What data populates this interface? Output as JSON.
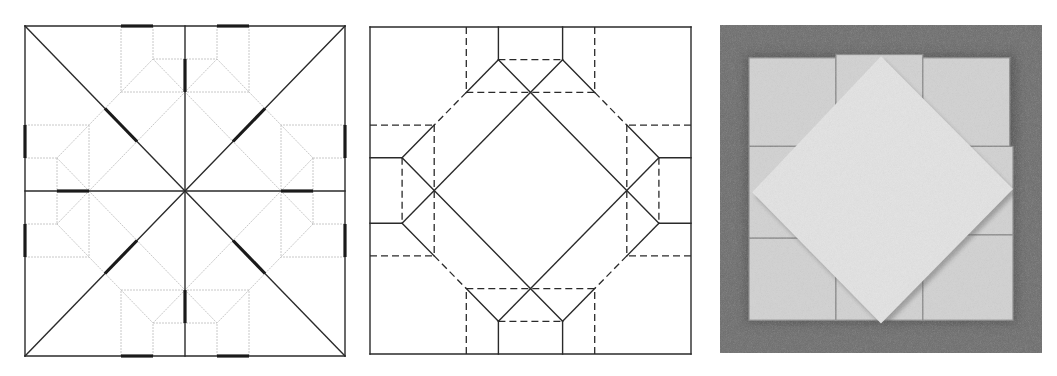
{
  "figure": {
    "description": "Origami crease pattern, fold-line diagram and photo of folded result",
    "panels": [
      {
        "id": "crease-pattern",
        "label": "Crease pattern with reference marks",
        "grid_units": 10,
        "colors": {
          "main": "#2a2a2a",
          "light": "#c8c8c8",
          "mark": "#1a1a1a"
        },
        "main_lines": [
          [
            [
              0,
              0
            ],
            [
              10,
              0
            ]
          ],
          [
            [
              10,
              0
            ],
            [
              10,
              10
            ]
          ],
          [
            [
              10,
              10
            ],
            [
              0,
              10
            ]
          ],
          [
            [
              0,
              10
            ],
            [
              0,
              0
            ]
          ],
          [
            [
              0,
              0
            ],
            [
              10,
              10
            ]
          ],
          [
            [
              10,
              0
            ],
            [
              0,
              10
            ]
          ],
          [
            [
              5,
              0
            ],
            [
              5,
              10
            ]
          ],
          [
            [
              0,
              5
            ],
            [
              10,
              5
            ]
          ]
        ],
        "light_lines": [
          [
            [
              3,
              0
            ],
            [
              3,
              2
            ]
          ],
          [
            [
              7,
              0
            ],
            [
              7,
              2
            ]
          ],
          [
            [
              4,
              0
            ],
            [
              4,
              1
            ]
          ],
          [
            [
              6,
              0
            ],
            [
              6,
              1
            ]
          ],
          [
            [
              4,
              1
            ],
            [
              6,
              1
            ]
          ],
          [
            [
              3,
              2
            ],
            [
              7,
              2
            ]
          ],
          [
            [
              3,
              10
            ],
            [
              3,
              8
            ]
          ],
          [
            [
              7,
              10
            ],
            [
              7,
              8
            ]
          ],
          [
            [
              4,
              10
            ],
            [
              4,
              9
            ]
          ],
          [
            [
              6,
              10
            ],
            [
              6,
              9
            ]
          ],
          [
            [
              4,
              9
            ],
            [
              6,
              9
            ]
          ],
          [
            [
              3,
              8
            ],
            [
              7,
              8
            ]
          ],
          [
            [
              0,
              3
            ],
            [
              2,
              3
            ]
          ],
          [
            [
              0,
              7
            ],
            [
              2,
              7
            ]
          ],
          [
            [
              0,
              4
            ],
            [
              1,
              4
            ]
          ],
          [
            [
              0,
              6
            ],
            [
              1,
              6
            ]
          ],
          [
            [
              1,
              4
            ],
            [
              1,
              6
            ]
          ],
          [
            [
              2,
              3
            ],
            [
              2,
              7
            ]
          ],
          [
            [
              10,
              3
            ],
            [
              8,
              3
            ]
          ],
          [
            [
              10,
              7
            ],
            [
              8,
              7
            ]
          ],
          [
            [
              10,
              4
            ],
            [
              9,
              4
            ]
          ],
          [
            [
              10,
              6
            ],
            [
              9,
              6
            ]
          ],
          [
            [
              9,
              4
            ],
            [
              9,
              6
            ]
          ],
          [
            [
              8,
              3
            ],
            [
              8,
              7
            ]
          ],
          [
            [
              4,
              1
            ],
            [
              9,
              6
            ]
          ],
          [
            [
              6,
              1
            ],
            [
              1,
              6
            ]
          ],
          [
            [
              1,
              4
            ],
            [
              6,
              9
            ]
          ],
          [
            [
              9,
              4
            ],
            [
              4,
              9
            ]
          ],
          [
            [
              4,
              1
            ],
            [
              3,
              2
            ]
          ],
          [
            [
              6,
              1
            ],
            [
              7,
              2
            ]
          ],
          [
            [
              3,
              2
            ],
            [
              2,
              3
            ]
          ],
          [
            [
              7,
              2
            ],
            [
              8,
              3
            ]
          ],
          [
            [
              2,
              3
            ],
            [
              1,
              4
            ]
          ],
          [
            [
              8,
              3
            ],
            [
              9,
              4
            ]
          ],
          [
            [
              1,
              6
            ],
            [
              2,
              7
            ]
          ],
          [
            [
              9,
              6
            ],
            [
              8,
              7
            ]
          ],
          [
            [
              2,
              7
            ],
            [
              3,
              8
            ]
          ],
          [
            [
              8,
              7
            ],
            [
              7,
              8
            ]
          ],
          [
            [
              3,
              8
            ],
            [
              4,
              9
            ]
          ],
          [
            [
              7,
              8
            ],
            [
              6,
              9
            ]
          ]
        ],
        "marks": [
          [
            [
              3,
              0
            ],
            [
              4,
              0
            ]
          ],
          [
            [
              6,
              0
            ],
            [
              7,
              0
            ]
          ],
          [
            [
              3,
              10
            ],
            [
              4,
              10
            ]
          ],
          [
            [
              6,
              10
            ],
            [
              7,
              10
            ]
          ],
          [
            [
              0,
              3
            ],
            [
              0,
              4
            ]
          ],
          [
            [
              0,
              6
            ],
            [
              0,
              7
            ]
          ],
          [
            [
              10,
              3
            ],
            [
              10,
              4
            ]
          ],
          [
            [
              10,
              6
            ],
            [
              10,
              7
            ]
          ],
          [
            [
              5,
              1
            ],
            [
              5,
              2
            ]
          ],
          [
            [
              5,
              8
            ],
            [
              5,
              9
            ]
          ],
          [
            [
              1,
              5
            ],
            [
              2,
              5
            ]
          ],
          [
            [
              8,
              5
            ],
            [
              9,
              5
            ]
          ],
          [
            [
              2.5,
              2.5
            ],
            [
              3.5,
              3.5
            ]
          ],
          [
            [
              7.5,
              2.5
            ],
            [
              6.5,
              3.5
            ]
          ],
          [
            [
              2.5,
              7.5
            ],
            [
              3.5,
              6.5
            ]
          ],
          [
            [
              7.5,
              7.5
            ],
            [
              6.5,
              6.5
            ]
          ]
        ]
      },
      {
        "id": "fold-diagram",
        "label": "Mountain (solid) and valley (dashed) fold lines",
        "grid_units": 10,
        "colors": {
          "line": "#2a2a2a"
        },
        "solid_lines": [
          [
            [
              0,
              0
            ],
            [
              10,
              0
            ]
          ],
          [
            [
              10,
              0
            ],
            [
              10,
              10
            ]
          ],
          [
            [
              10,
              10
            ],
            [
              0,
              10
            ]
          ],
          [
            [
              0,
              10
            ],
            [
              0,
              0
            ]
          ],
          [
            [
              4,
              1
            ],
            [
              9,
              6
            ]
          ],
          [
            [
              6,
              1
            ],
            [
              1,
              6
            ]
          ],
          [
            [
              1,
              4
            ],
            [
              6,
              9
            ]
          ],
          [
            [
              9,
              4
            ],
            [
              4,
              9
            ]
          ],
          [
            [
              4,
              0
            ],
            [
              4,
              1
            ]
          ],
          [
            [
              6,
              0
            ],
            [
              6,
              1
            ]
          ],
          [
            [
              4,
              10
            ],
            [
              4,
              9
            ]
          ],
          [
            [
              6,
              10
            ],
            [
              6,
              9
            ]
          ],
          [
            [
              0,
              4
            ],
            [
              1,
              4
            ]
          ],
          [
            [
              0,
              6
            ],
            [
              1,
              6
            ]
          ],
          [
            [
              10,
              4
            ],
            [
              9,
              4
            ]
          ],
          [
            [
              10,
              6
            ],
            [
              9,
              6
            ]
          ],
          [
            [
              4,
              1
            ],
            [
              3,
              2
            ]
          ],
          [
            [
              6,
              1
            ],
            [
              7,
              2
            ]
          ],
          [
            [
              2,
              3
            ],
            [
              1,
              4
            ]
          ],
          [
            [
              8,
              3
            ],
            [
              9,
              4
            ]
          ],
          [
            [
              1,
              6
            ],
            [
              2,
              7
            ]
          ],
          [
            [
              9,
              6
            ],
            [
              8,
              7
            ]
          ],
          [
            [
              3,
              8
            ],
            [
              4,
              9
            ]
          ],
          [
            [
              7,
              8
            ],
            [
              6,
              9
            ]
          ]
        ],
        "dashed_lines": [
          [
            [
              3,
              0
            ],
            [
              3,
              2
            ]
          ],
          [
            [
              7,
              0
            ],
            [
              7,
              2
            ]
          ],
          [
            [
              4,
              1
            ],
            [
              6,
              1
            ]
          ],
          [
            [
              3,
              2
            ],
            [
              7,
              2
            ]
          ],
          [
            [
              3,
              10
            ],
            [
              3,
              8
            ]
          ],
          [
            [
              7,
              10
            ],
            [
              7,
              8
            ]
          ],
          [
            [
              4,
              9
            ],
            [
              6,
              9
            ]
          ],
          [
            [
              3,
              8
            ],
            [
              7,
              8
            ]
          ],
          [
            [
              0,
              3
            ],
            [
              2,
              3
            ]
          ],
          [
            [
              0,
              7
            ],
            [
              2,
              7
            ]
          ],
          [
            [
              1,
              4
            ],
            [
              1,
              6
            ]
          ],
          [
            [
              2,
              3
            ],
            [
              2,
              7
            ]
          ],
          [
            [
              10,
              3
            ],
            [
              8,
              3
            ]
          ],
          [
            [
              10,
              7
            ],
            [
              8,
              7
            ]
          ],
          [
            [
              9,
              4
            ],
            [
              9,
              6
            ]
          ],
          [
            [
              8,
              3
            ],
            [
              8,
              7
            ]
          ],
          [
            [
              3,
              2
            ],
            [
              2,
              3
            ]
          ],
          [
            [
              7,
              2
            ],
            [
              8,
              3
            ]
          ],
          [
            [
              2,
              7
            ],
            [
              3,
              8
            ]
          ],
          [
            [
              8,
              7
            ],
            [
              7,
              8
            ]
          ]
        ]
      },
      {
        "id": "folded-photo",
        "label": "Photo of folded model",
        "grid_units": 10,
        "colors": {
          "background": "#6d6d6d",
          "paper": "#e3e3e3",
          "paper_shade": "#d2d2d2",
          "shadow": "#8a8a8a"
        },
        "paper_square": [
          [
            0.9,
            1.0
          ],
          [
            9.1,
            9.0
          ]
        ],
        "flaps": [
          {
            "name": "top-left-flap",
            "rect": [
              [
                0.9,
                1.0
              ],
              [
                3.6,
                3.7
              ]
            ]
          },
          {
            "name": "top-middle-flap",
            "rect": [
              [
                3.6,
                0.9
              ],
              [
                6.3,
                3.0
              ]
            ]
          },
          {
            "name": "top-right-flap",
            "rect": [
              [
                6.3,
                1.0
              ],
              [
                9.0,
                3.7
              ]
            ]
          },
          {
            "name": "left-middle-flap",
            "rect": [
              [
                0.9,
                3.7
              ],
              [
                2.5,
                6.5
              ]
            ]
          },
          {
            "name": "right-middle-flap",
            "rect": [
              [
                7.6,
                3.7
              ],
              [
                9.1,
                6.4
              ]
            ]
          },
          {
            "name": "bottom-left-flap",
            "rect": [
              [
                0.9,
                6.5
              ],
              [
                3.6,
                9.0
              ]
            ]
          },
          {
            "name": "bottom-middle-flap",
            "rect": [
              [
                3.6,
                7.0
              ],
              [
                6.3,
                9.0
              ]
            ]
          },
          {
            "name": "bottom-right-flap",
            "rect": [
              [
                6.3,
                6.4
              ],
              [
                9.1,
                9.0
              ]
            ]
          }
        ],
        "diamond": [
          [
            5.0,
            0.95
          ],
          [
            9.1,
            5.0
          ],
          [
            5.0,
            9.1
          ],
          [
            1.0,
            5.1
          ]
        ]
      }
    ]
  }
}
